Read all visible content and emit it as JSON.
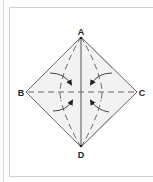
{
  "diagram": {
    "type": "origami-fold-diagram",
    "vertices": {
      "top": "A",
      "left": "B",
      "right": "C",
      "bottom": "D"
    },
    "lines": {
      "vertical_A_D": "solid",
      "horizontal_B_C": "dashed",
      "fold_lines_from_A": "dashed",
      "fold_lines_from_D": "dashed"
    },
    "arrows": {
      "count": 4,
      "direction": "curved-toward-center"
    },
    "colors": {
      "paper_fill": "#f2f2f2",
      "line": "#555555",
      "frame": "#cfcfcf",
      "label": "#222222"
    }
  }
}
